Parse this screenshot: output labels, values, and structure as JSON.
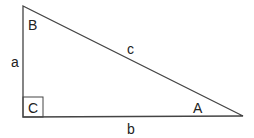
{
  "diagram": {
    "type": "right-triangle",
    "colors": {
      "line": "#444444",
      "text": "#222222",
      "background": "#ffffff"
    },
    "vertices": {
      "B": {
        "label": "B",
        "x": 23,
        "y": 6
      },
      "C": {
        "label": "C",
        "x": 23,
        "y": 117
      },
      "A": {
        "label": "A",
        "x": 243,
        "y": 116
      }
    },
    "sides": {
      "a": {
        "label": "a",
        "between": [
          "B",
          "C"
        ]
      },
      "b": {
        "label": "b",
        "between": [
          "C",
          "A"
        ]
      },
      "c": {
        "label": "c",
        "between": [
          "B",
          "A"
        ]
      }
    },
    "right_angle_marker": {
      "at": "C",
      "size": 20
    }
  }
}
